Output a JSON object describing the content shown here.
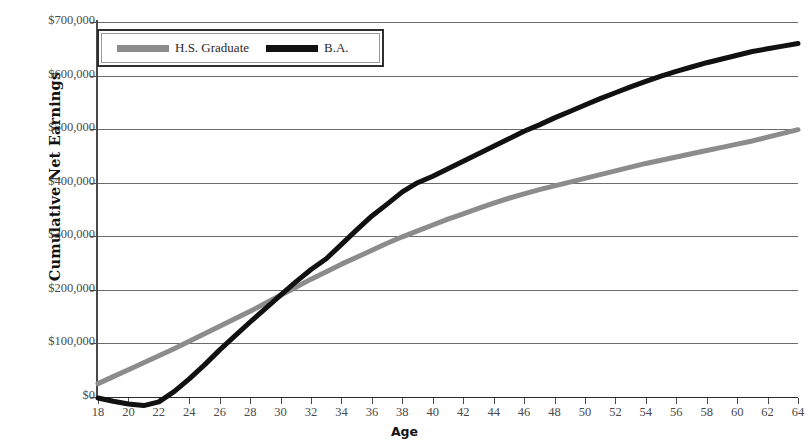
{
  "chart_data": {
    "type": "line",
    "title": "",
    "xlabel": "Age",
    "ylabel": "Cumulative Net Earnings",
    "xlim": [
      18,
      64
    ],
    "ylim": [
      -50000,
      700000
    ],
    "grid": true,
    "legend_position": "top-left",
    "x_ticks": [
      18,
      20,
      22,
      24,
      26,
      28,
      30,
      32,
      34,
      36,
      38,
      40,
      42,
      44,
      46,
      48,
      50,
      52,
      54,
      56,
      58,
      60,
      62,
      64
    ],
    "x_tick_labels": [
      "18",
      "20",
      "22",
      "24",
      "26",
      "28",
      "30",
      "32",
      "34",
      "36",
      "38",
      "40",
      "42",
      "44",
      "46",
      "48",
      "50",
      "52",
      "54",
      "56",
      "58",
      "60",
      "62",
      "64"
    ],
    "y_ticks": [
      0,
      100000,
      200000,
      300000,
      400000,
      500000,
      600000,
      700000
    ],
    "y_tick_labels": [
      "$0",
      "$100,000",
      "$200,000",
      "$300,000",
      "$400,000",
      "$500,000",
      "$600,000",
      "$700,000"
    ],
    "x": [
      18,
      19,
      20,
      21,
      22,
      23,
      24,
      25,
      26,
      27,
      28,
      29,
      30,
      31,
      32,
      33,
      34,
      35,
      36,
      37,
      38,
      39,
      40,
      41,
      42,
      43,
      44,
      45,
      46,
      47,
      48,
      49,
      50,
      51,
      52,
      53,
      54,
      55,
      56,
      57,
      58,
      59,
      60,
      61,
      62,
      63,
      64
    ],
    "series": [
      {
        "name": "H.S. Graduate",
        "color": "#8c8c8c",
        "values": [
          25000,
          38000,
          51000,
          64000,
          77000,
          90000,
          104000,
          118000,
          132000,
          146000,
          160000,
          175000,
          190000,
          205000,
          220000,
          234000,
          248000,
          261000,
          274000,
          287000,
          299000,
          310000,
          321000,
          332000,
          342000,
          352000,
          362000,
          371000,
          379000,
          387000,
          394000,
          401000,
          408000,
          415000,
          422000,
          429000,
          436000,
          442000,
          448000,
          454000,
          460000,
          466000,
          472000,
          478000,
          485000,
          492000,
          499000
        ]
      },
      {
        "name": "B.A.",
        "color": "#111111",
        "values": [
          -2000,
          -8000,
          -13000,
          -16000,
          -9000,
          10000,
          34000,
          60000,
          88000,
          114000,
          140000,
          165000,
          190000,
          215000,
          238000,
          258000,
          285000,
          312000,
          338000,
          360000,
          383000,
          400000,
          412000,
          426000,
          440000,
          454000,
          468000,
          482000,
          496000,
          508000,
          521000,
          533000,
          545000,
          557000,
          568000,
          579000,
          589000,
          599000,
          608000,
          616000,
          624000,
          631000,
          638000,
          645000,
          650000,
          655000,
          660000
        ]
      }
    ],
    "annotations": {
      "crossover_age": 33,
      "crossover_value": 255000,
      "ba_minimum_age": 21,
      "ba_minimum_value": -16000
    }
  },
  "legend": {
    "items": [
      {
        "label": "H.S. Graduate",
        "color": "#8c8c8c"
      },
      {
        "label": "B.A.",
        "color": "#111111"
      }
    ]
  }
}
